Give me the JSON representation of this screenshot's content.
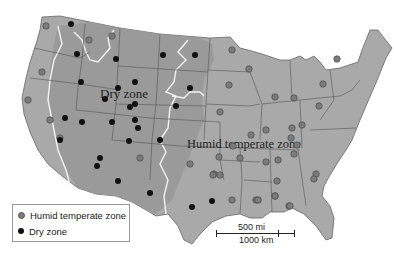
{
  "map": {
    "labels": {
      "dry_zone": "Dry zone",
      "humid_zone": "Humid temperate zone"
    },
    "colors": {
      "land": "#a9a9a9",
      "dry_land": "#9a9a9a",
      "border": "#555555",
      "zone_boundary": "#f2f2f2",
      "humid_dot": "#7b7b7b",
      "dry_dot": "#111111"
    },
    "legend": [
      {
        "label": "Humid temperate zone",
        "symbol": "gray-dot"
      },
      {
        "label": "Dry zone",
        "symbol": "black-dot"
      }
    ],
    "scale": {
      "miles": "500 mi",
      "km": "1000 km"
    },
    "station_counts": {
      "humid": 44,
      "dry": 30
    }
  }
}
